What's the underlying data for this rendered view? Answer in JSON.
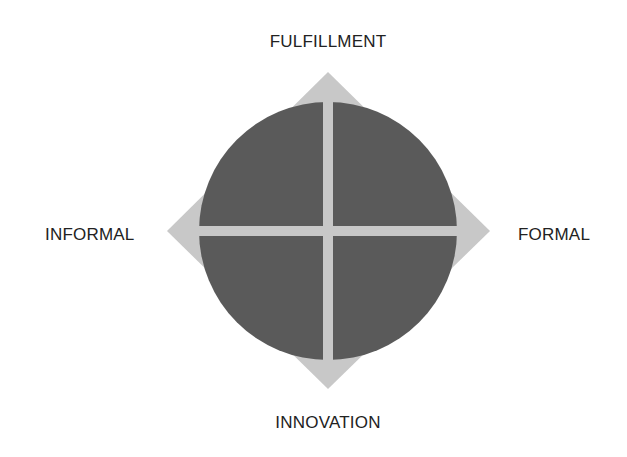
{
  "diagram": {
    "labels": {
      "top": "FULFILLMENT",
      "bottom": "INNOVATION",
      "left": "INFORMAL",
      "right": "FORMAL"
    },
    "colors": {
      "circle": "#5a5a5a",
      "diamond": "#c8c8c8",
      "cross": "#c8c8c8",
      "text": "#222222",
      "background": "#ffffff"
    },
    "geometry": {
      "center": [
        328,
        231
      ],
      "circle_radius": 129,
      "diamond_tips": {
        "top": [
          328,
          72
        ],
        "bottom": [
          328,
          389
        ],
        "left": [
          167,
          231
        ],
        "right": [
          490,
          231
        ]
      },
      "cross_thickness": 10
    }
  }
}
